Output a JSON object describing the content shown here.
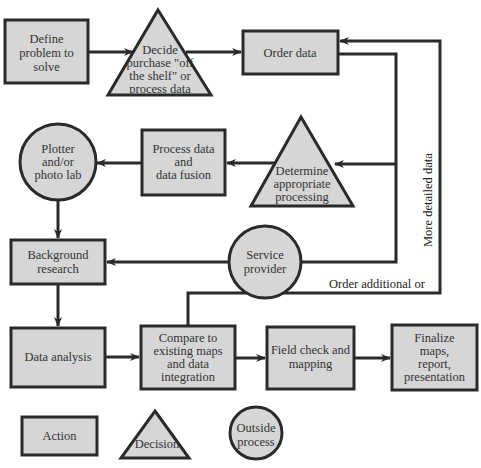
{
  "diagram": {
    "nodes": {
      "define": {
        "type": "action",
        "lines": [
          "Define",
          "problem to",
          "solve"
        ]
      },
      "decide": {
        "type": "decision",
        "lines": [
          "Decide",
          "purchase \"off",
          "the shelf\" or",
          "process data"
        ]
      },
      "order": {
        "type": "action",
        "lines": [
          "Order data"
        ]
      },
      "determine": {
        "type": "decision",
        "lines": [
          "Determine",
          "appropriate",
          "processing"
        ]
      },
      "process": {
        "type": "action",
        "lines": [
          "Process data",
          "and",
          "data fusion"
        ]
      },
      "plotter": {
        "type": "outside",
        "lines": [
          "Plotter",
          "and/or",
          "photo lab"
        ]
      },
      "background": {
        "type": "action",
        "lines": [
          "Background",
          "research"
        ]
      },
      "service": {
        "type": "outside",
        "lines": [
          "Service",
          "provider"
        ]
      },
      "analysis": {
        "type": "action",
        "lines": [
          "Data analysis"
        ]
      },
      "compare": {
        "type": "action",
        "lines": [
          "Compare to",
          "existing maps",
          "and data",
          "integration"
        ]
      },
      "field": {
        "type": "action",
        "lines": [
          "Field check and",
          "mapping"
        ]
      },
      "finalize": {
        "type": "action",
        "lines": [
          "Finalize",
          "maps,",
          "report,",
          "presentation"
        ]
      }
    },
    "edge_labels": {
      "vertical": "More detailed data",
      "horizontal": "Order additional or"
    },
    "legend": {
      "action": "Action",
      "decision": "Decision",
      "outside": [
        "Outside",
        "process"
      ]
    },
    "colors": {
      "fill": "#d6d6d6",
      "stroke": "#2a2a2a",
      "background": "#ffffff"
    }
  }
}
